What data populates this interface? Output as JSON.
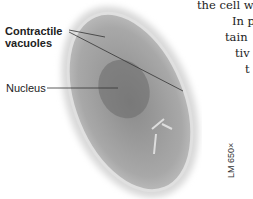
{
  "figure": {
    "labels": {
      "contractile_line1": "Contractile",
      "contractile_line2": "vacuoles",
      "nucleus": "Nucleus"
    },
    "magnification": "LM 650×"
  },
  "body_text": {
    "line1": "the cell wo",
    "line2": "In p",
    "line3": "tain",
    "line4": "tiv",
    "line5": "t"
  }
}
